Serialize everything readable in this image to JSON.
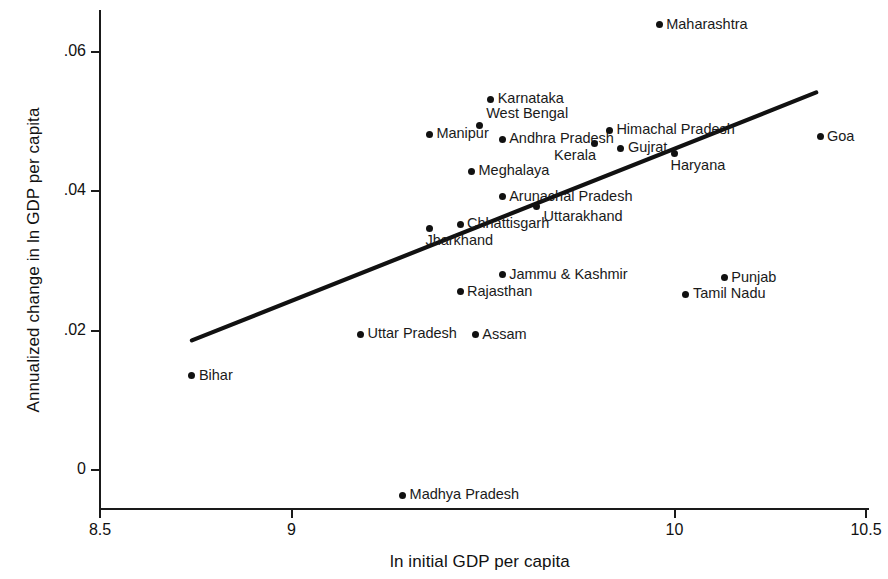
{
  "chart_data": {
    "type": "scatter",
    "title": "",
    "xlabel": "ln initial GDP per capita",
    "ylabel": "Annualized change in ln GDP per capita",
    "xlim": [
      8.37,
      10.58
    ],
    "ylim": [
      -0.0055,
      0.0665
    ],
    "xticks": [
      8.5,
      9,
      10,
      10.5
    ],
    "xtick_labels": [
      "8.5",
      "9",
      "10",
      "10.5"
    ],
    "yticks": [
      0,
      0.02,
      0.04,
      0.06
    ],
    "ytick_labels": [
      "0",
      ".02",
      ".04",
      ".06"
    ],
    "grid": false,
    "legend": "none",
    "marker_color": "#111111",
    "line_color": "#111111",
    "points": [
      {
        "label": "Maharashtra",
        "x": 9.96,
        "y": 0.0639,
        "label_side": "right"
      },
      {
        "label": "Karnataka",
        "x": 9.52,
        "y": 0.0532,
        "label_side": "right"
      },
      {
        "label": "West Bengal",
        "x": 9.49,
        "y": 0.0495,
        "label_side": "right-above"
      },
      {
        "label": "Manipur",
        "x": 9.36,
        "y": 0.0482,
        "label_side": "right"
      },
      {
        "label": "Andhra Pradesh",
        "x": 9.55,
        "y": 0.0475,
        "label_side": "right"
      },
      {
        "label": "Himachal Pradesh",
        "x": 9.83,
        "y": 0.0488,
        "label_side": "right"
      },
      {
        "label": "Kerala",
        "x": 9.79,
        "y": 0.0468,
        "label_side": "below-left"
      },
      {
        "label": "Gujrat",
        "x": 9.86,
        "y": 0.0462,
        "label_side": "right"
      },
      {
        "label": "Goa",
        "x": 10.38,
        "y": 0.0478,
        "label_side": "right"
      },
      {
        "label": "Haryana",
        "x": 10.0,
        "y": 0.0455,
        "label_side": "below-right"
      },
      {
        "label": "Meghalaya",
        "x": 9.47,
        "y": 0.0429,
        "label_side": "right"
      },
      {
        "label": "Arunachal Pradesh",
        "x": 9.55,
        "y": 0.0392,
        "label_side": "right"
      },
      {
        "label": "Uttarakhand",
        "x": 9.64,
        "y": 0.0378,
        "label_side": "right-below"
      },
      {
        "label": "Chhattisgarh",
        "x": 9.44,
        "y": 0.0353,
        "label_side": "right"
      },
      {
        "label": "Jharkhand",
        "x": 9.36,
        "y": 0.0347,
        "label_side": "below-right"
      },
      {
        "label": "Jammu & Kashmir",
        "x": 9.55,
        "y": 0.028,
        "label_side": "right"
      },
      {
        "label": "Punjab",
        "x": 10.13,
        "y": 0.0276,
        "label_side": "right"
      },
      {
        "label": "Rajasthan",
        "x": 9.44,
        "y": 0.0256,
        "label_side": "right"
      },
      {
        "label": "Tamil Nadu",
        "x": 10.03,
        "y": 0.0252,
        "label_side": "right"
      },
      {
        "label": "Uttar Pradesh",
        "x": 9.18,
        "y": 0.0195,
        "label_side": "right"
      },
      {
        "label": "Assam",
        "x": 9.48,
        "y": 0.0194,
        "label_side": "right"
      },
      {
        "label": "Bihar",
        "x": 8.74,
        "y": 0.0135,
        "label_side": "right"
      },
      {
        "label": "Madhya Pradesh",
        "x": 9.29,
        "y": -0.0036,
        "label_side": "right"
      }
    ],
    "fit_line": {
      "name": "linear fit",
      "x_start": 8.74,
      "y_start": 0.0186,
      "x_end": 10.37,
      "y_end": 0.0542
    }
  }
}
